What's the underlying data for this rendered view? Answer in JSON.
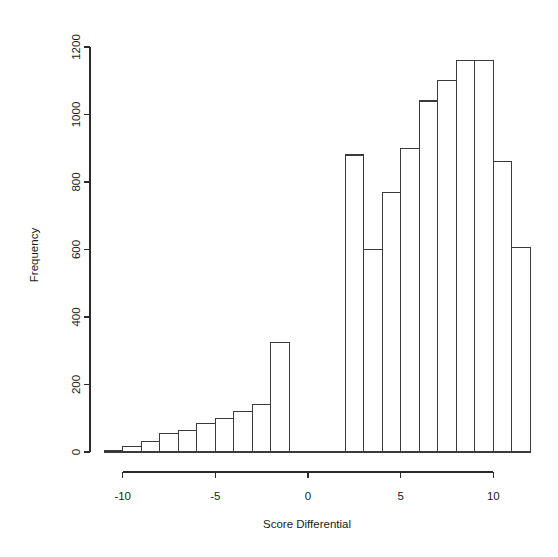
{
  "chart_data": {
    "type": "bar",
    "title": "",
    "subtitle": "",
    "xlabel": "Score Differential",
    "ylabel": "Frequency",
    "grid": false,
    "legend": null,
    "xlim": [
      -11.6,
      12.2
    ],
    "ylim": [
      0,
      1230
    ],
    "x_ticks": [
      -10,
      -5,
      0,
      5,
      10
    ],
    "x_tick_labels": [
      "-10",
      "-5",
      "0",
      "5",
      "10"
    ],
    "y_ticks": [
      0,
      200,
      400,
      600,
      800,
      1000,
      1200
    ],
    "y_tick_labels": [
      "0",
      "200",
      "400",
      "600",
      "800",
      "1000",
      "1200"
    ],
    "bin_width": 1,
    "bin_starts": [
      -11,
      -10,
      -9,
      -8,
      -7,
      -6,
      -5,
      -4,
      -3,
      -2,
      -1,
      0,
      1,
      2,
      3,
      4,
      5,
      6,
      7,
      8,
      9,
      10,
      11
    ],
    "categories": [
      "-11",
      "-10",
      "-9",
      "-8",
      "-7",
      "-6",
      "-5",
      "-4",
      "-3",
      "-2",
      "-1",
      "0",
      "1",
      "2",
      "3",
      "4",
      "5",
      "6",
      "7",
      "8",
      "9",
      "10",
      "11"
    ],
    "values": [
      5,
      15,
      30,
      55,
      65,
      85,
      100,
      120,
      140,
      325,
      0,
      0,
      0,
      880,
      600,
      770,
      900,
      1040,
      1100,
      1160,
      1160,
      860,
      605
    ],
    "bar_fill": "none",
    "bar_stroke": "#3a3a3a",
    "axis_color": "#2b2b2b",
    "background": "#ffffff"
  },
  "axes": {
    "x_axis_title": "Score Differential",
    "y_axis_title": "Frequency"
  }
}
